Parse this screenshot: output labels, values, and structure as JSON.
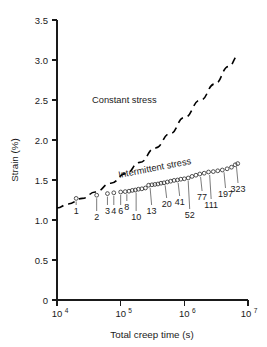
{
  "chart_data": {
    "type": "scatter",
    "title": "",
    "xlabel": "Total creep time (s)",
    "ylabel": "Strain (%)",
    "xscale": "log",
    "yscale": "linear",
    "xlim": [
      10000,
      10000000
    ],
    "ylim": [
      0,
      3.5
    ],
    "xticks": [
      "10⁴",
      "10⁵",
      "10⁶",
      "10⁷"
    ],
    "xtick_values": [
      10000,
      100000,
      1000000,
      10000000
    ],
    "xtick_mantissa": [
      "10",
      "10",
      "10",
      "10"
    ],
    "xtick_exponent": [
      "4",
      "5",
      "6",
      "7"
    ],
    "yticks": [
      "0",
      "0.5",
      "1.0",
      "1.5",
      "2.0",
      "2.5",
      "3.0",
      "3.5"
    ],
    "ytick_values": [
      0,
      0.5,
      1.0,
      1.5,
      2.0,
      2.5,
      3.0,
      3.5
    ],
    "grid": false,
    "legend": "inline-annotations",
    "series": [
      {
        "name": "Constant stress",
        "style": "dashed-line",
        "label_text": "Constant stress",
        "x": [
          10000,
          15000,
          25000,
          40000,
          70000,
          120000,
          200000,
          350000,
          600000,
          1000000,
          1800000,
          3000000,
          5000000,
          7000000
        ],
        "y": [
          1.15,
          1.2,
          1.27,
          1.35,
          1.46,
          1.58,
          1.72,
          1.9,
          2.08,
          2.28,
          2.5,
          2.7,
          2.92,
          3.05
        ]
      },
      {
        "name": "Intermittent stress",
        "style": "open-circles",
        "label_text": "Intermittent stress",
        "x": [
          20000,
          42000,
          62000,
          78000,
          100000,
          118000,
          135000,
          152000,
          170000,
          190000,
          215000,
          245000,
          275000,
          310000,
          345000,
          385000,
          430000,
          480000,
          540000,
          610000,
          690000,
          780000,
          880000,
          1000000,
          1150000,
          1320000,
          1520000,
          1750000,
          2050000,
          2400000,
          2850000,
          3350000,
          3950000,
          4700000,
          5500000,
          6300000,
          6900000
        ],
        "y": [
          1.27,
          1.31,
          1.33,
          1.34,
          1.35,
          1.355,
          1.36,
          1.37,
          1.375,
          1.385,
          1.39,
          1.4,
          1.435,
          1.44,
          1.445,
          1.45,
          1.46,
          1.465,
          1.475,
          1.485,
          1.495,
          1.5,
          1.51,
          1.515,
          1.525,
          1.545,
          1.56,
          1.575,
          1.585,
          1.6,
          1.605,
          1.615,
          1.625,
          1.64,
          1.66,
          1.69,
          1.705
        ]
      }
    ],
    "point_annotations": [
      {
        "label": "1",
        "x": 20000,
        "y": 1.27
      },
      {
        "label": "2",
        "x": 42000,
        "y": 1.31
      },
      {
        "label": "3",
        "x": 62000,
        "y": 1.33
      },
      {
        "label": "4",
        "x": 78000,
        "y": 1.34
      },
      {
        "label": "6",
        "x": 100000,
        "y": 1.35
      },
      {
        "label": "8",
        "x": 125000,
        "y": 1.36
      },
      {
        "label": "10",
        "x": 175000,
        "y": 1.38
      },
      {
        "label": "13",
        "x": 290000,
        "y": 1.44
      },
      {
        "label": "20",
        "x": 500000,
        "y": 1.47
      },
      {
        "label": "41",
        "x": 800000,
        "y": 1.5
      },
      {
        "label": "52",
        "x": 1150000,
        "y": 1.525
      },
      {
        "label": "77",
        "x": 1800000,
        "y": 1.575
      },
      {
        "label": "111",
        "x": 2500000,
        "y": 1.6
      },
      {
        "label": "197",
        "x": 4200000,
        "y": 1.635
      },
      {
        "label": "323",
        "x": 6600000,
        "y": 1.7
      }
    ]
  },
  "axes": {
    "y_title": "Strain (%)",
    "x_title": "Total creep time (s)"
  },
  "annotations": {
    "constant_stress": "Constant stress",
    "intermittent_stress": "Intermittent stress"
  }
}
